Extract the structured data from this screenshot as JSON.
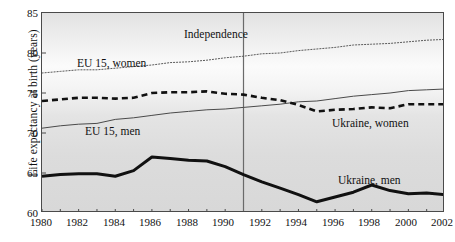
{
  "chart_data": {
    "type": "line",
    "title": "",
    "xlabel": "",
    "ylabel": "Life expectancy at birth (years)",
    "xlim": [
      1980,
      2002
    ],
    "ylim": [
      60,
      85
    ],
    "xticks": [
      1980,
      1982,
      1984,
      1986,
      1988,
      1990,
      1992,
      1994,
      1996,
      1998,
      2000,
      2002
    ],
    "yticks": [
      60,
      65,
      70,
      75,
      80,
      85
    ],
    "grid": false,
    "legend_position": "inline-labels",
    "x": [
      1980,
      1981,
      1982,
      1983,
      1984,
      1985,
      1986,
      1987,
      1988,
      1989,
      1990,
      1991,
      1992,
      1993,
      1994,
      1995,
      1996,
      1997,
      1998,
      1999,
      2000,
      2001,
      2002
    ],
    "series": [
      {
        "name": "EU 15, women",
        "style": "dotted",
        "color": "#5a5a5a",
        "width": 1.0,
        "values": [
          77.5,
          77.7,
          77.9,
          77.9,
          78.1,
          78.3,
          78.5,
          78.8,
          78.9,
          79.1,
          79.4,
          79.6,
          79.9,
          80.0,
          80.3,
          80.5,
          80.7,
          81.0,
          81.1,
          81.2,
          81.4,
          81.6,
          81.7
        ]
      },
      {
        "name": "EU 15, men",
        "style": "solid-thin",
        "color": "#4a4a4a",
        "width": 1.0,
        "values": [
          70.6,
          70.9,
          71.1,
          71.2,
          71.7,
          71.9,
          72.2,
          72.5,
          72.7,
          72.9,
          73.0,
          73.2,
          73.4,
          73.6,
          73.9,
          74.0,
          74.3,
          74.6,
          74.8,
          75.0,
          75.3,
          75.4,
          75.5
        ]
      },
      {
        "name": "Ukraine, women",
        "style": "dashed-thick",
        "color": "#111111",
        "width": 2.6,
        "values": [
          74.0,
          74.2,
          74.4,
          74.4,
          74.3,
          74.4,
          75.0,
          75.1,
          75.1,
          75.2,
          74.9,
          74.8,
          74.4,
          74.1,
          73.5,
          72.7,
          72.9,
          73.0,
          73.2,
          73.1,
          73.6,
          73.6,
          73.6
        ]
      },
      {
        "name": "Ukraine, men",
        "style": "solid-thick",
        "color": "#111111",
        "width": 3.0,
        "values": [
          64.6,
          64.8,
          64.9,
          64.9,
          64.6,
          65.3,
          67.0,
          66.8,
          66.6,
          66.5,
          65.8,
          64.8,
          63.9,
          63.1,
          62.3,
          61.4,
          62.0,
          62.6,
          63.5,
          62.8,
          62.4,
          62.5,
          62.3
        ]
      }
    ],
    "annotations": [
      {
        "id": "independence",
        "label": "Independence",
        "x": 1991,
        "type": "vline-label"
      },
      {
        "id": "eu-women-label",
        "label": "EU 15, women",
        "type": "series-label"
      },
      {
        "id": "eu-men-label",
        "label": "EU 15, men",
        "type": "series-label"
      },
      {
        "id": "ua-women-label",
        "label": "Ukraine, women",
        "type": "series-label"
      },
      {
        "id": "ua-men-label",
        "label": "Ukraine, men",
        "type": "series-label"
      }
    ],
    "vline": {
      "x": 1991,
      "color": "#6a6a6a",
      "width": 1.2
    }
  },
  "axes": {
    "y_title": "Life expectancy at birth (years)",
    "y_tick_labels": [
      "85",
      "80",
      "75",
      "70",
      "65",
      "60"
    ],
    "x_tick_labels": [
      "1980",
      "1982",
      "1984",
      "1986",
      "1988",
      "1990",
      "1992",
      "1994",
      "1996",
      "1998",
      "2000",
      "2002"
    ]
  },
  "labels": {
    "independence": "Independence",
    "eu_women": "EU 15, women",
    "eu_men": "EU 15, men",
    "ukraine_women": "Ukraine, women",
    "ukraine_men": "Ukraine, men"
  },
  "caption_strip": {
    "text": ""
  }
}
